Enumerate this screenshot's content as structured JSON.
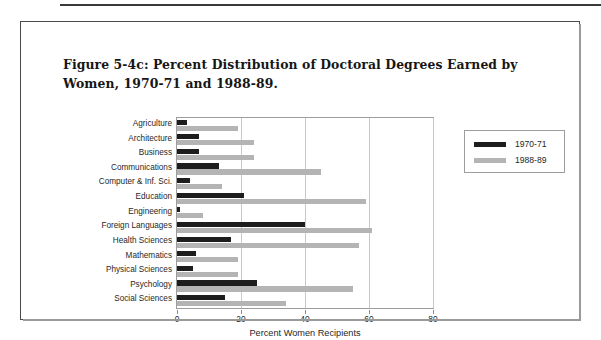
{
  "figure": {
    "caption": "Figure 5-4c: Percent Distribution of Doctoral Degrees Earned by Women, 1970-71 and 1988-89."
  },
  "legend": {
    "items": [
      {
        "label": "1970-71",
        "color": "#1d1d1d"
      },
      {
        "label": "1988-89",
        "color": "#b4b4b4"
      }
    ]
  },
  "axis": {
    "x_title": "Percent Women Recipients",
    "ticks": [
      "0",
      "20",
      "40",
      "60",
      "80"
    ]
  },
  "chart_data": {
    "type": "bar",
    "orientation": "horizontal",
    "title": "Figure 5-4c: Percent Distribution of Doctoral Degrees Earned by Women, 1970-71 and 1988-89.",
    "xlabel": "Percent Women Recipients",
    "ylabel": "",
    "xlim": [
      0,
      80
    ],
    "xticks": [
      0,
      20,
      40,
      60,
      80
    ],
    "grid": true,
    "legend_position": "right",
    "categories": [
      "Agriculture",
      "Architecture",
      "Business",
      "Communications",
      "Computer & Inf. Sci.",
      "Education",
      "Engineering",
      "Foreign Languages",
      "Health Sciences",
      "Mathematics",
      "Physical Sciences",
      "Psychology",
      "Social Sciences"
    ],
    "series": [
      {
        "name": "1970-71",
        "color": "#1d1d1d",
        "values": [
          3,
          7,
          7,
          13,
          4,
          21,
          1,
          40,
          17,
          6,
          5,
          25,
          15
        ]
      },
      {
        "name": "1988-89",
        "color": "#b4b4b4",
        "values": [
          19,
          24,
          24,
          45,
          14,
          59,
          8,
          61,
          57,
          19,
          19,
          55,
          34
        ]
      }
    ]
  }
}
